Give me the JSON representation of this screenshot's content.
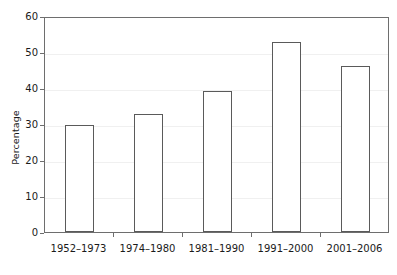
{
  "chart_data": {
    "type": "bar",
    "title": "",
    "subtitle": "",
    "xlabel": "",
    "ylabel": "Percentage",
    "categories": [
      "1952–1973",
      "1974–1980",
      "1981–1990",
      "1991–2000",
      "2001–2006"
    ],
    "values": [
      29.6,
      32.7,
      39.3,
      52.8,
      46.2
    ],
    "series": [
      {
        "name": "Percentage",
        "values": [
          29.6,
          32.7,
          39.3,
          52.8,
          46.2
        ]
      }
    ],
    "ylim": [
      0,
      60
    ],
    "xlim": [
      0,
      5
    ],
    "y_ticks": [
      0,
      10,
      20,
      30,
      40,
      50,
      60
    ],
    "y_tick_labels": [
      "0",
      "10",
      "20",
      "30",
      "40",
      "50",
      "60"
    ],
    "grid": "horizontal",
    "legend": "none",
    "bar_fill_color": "#ffffff",
    "bar_edge_color": "#5a5a5a",
    "gridline_color": "#f0f0f0",
    "axis_color": "#6e6e6e",
    "background_color": "#ffffff",
    "text_color": "#1a1a1a",
    "annotations": []
  }
}
